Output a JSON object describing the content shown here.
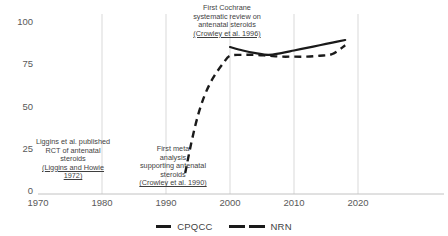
{
  "chart_data": {
    "type": "line",
    "title": "",
    "xlabel": "",
    "ylabel": "",
    "xlim": [
      1970,
      2020
    ],
    "ylim": [
      0,
      100
    ],
    "grid": "vertical-only",
    "legend_position": "bottom-center",
    "xticks": [
      "1970",
      "1980",
      "1990",
      "2000",
      "2010",
      "2020"
    ],
    "yticks": [
      "0",
      "25",
      "50",
      "75",
      "100"
    ],
    "series": [
      {
        "name": "CPQCC",
        "style": "solid",
        "color": "#1a1a1a",
        "x": [
          2000,
          2002,
          2004,
          2006,
          2008,
          2010,
          2012,
          2014,
          2016,
          2018
        ],
        "values": [
          84,
          82,
          80.5,
          79.5,
          80.5,
          82,
          83.5,
          85,
          86.5,
          88
        ]
      },
      {
        "name": "NRN",
        "style": "dashed",
        "color": "#1a1a1a",
        "x": [
          1993,
          1994,
          1995,
          1996,
          1997,
          1998,
          1999,
          2000,
          2002,
          2004,
          2006,
          2008,
          2010,
          2012,
          2014,
          2016,
          2018
        ],
        "values": [
          12,
          30,
          45,
          56,
          64,
          70,
          75,
          79,
          79.5,
          79.5,
          79,
          78.5,
          78.5,
          78.5,
          79,
          80,
          85
        ]
      }
    ],
    "annotations": [
      {
        "id": "liggins",
        "lines": [
          "Liggins et al. published",
          "RCT of antenatal",
          "steroids"
        ],
        "citation": [
          "(Liggins and Howie",
          "1972)"
        ]
      },
      {
        "id": "first-meta-analysis",
        "lines": [
          "First meta",
          "analysis",
          "supporting antenatal",
          "steroids"
        ],
        "citation": [
          "(Crowley et al. 1990)"
        ]
      },
      {
        "id": "first-cochrane",
        "lines": [
          "First Cochrane",
          "systematic review on",
          "antenatal steroids"
        ],
        "citation": [
          "(Crowley et al. 1996)"
        ]
      }
    ]
  },
  "legend": {
    "cpqcc_label": "CPQCC",
    "nrn_label": "NRN"
  },
  "annotations": {
    "liggins": {
      "l1": "Liggins et al. published",
      "l2": "RCT of antenatal",
      "l3": "steroids",
      "c1": "(Liggins and Howie",
      "c2": "1972)"
    },
    "meta": {
      "l1": "First meta",
      "l2": "analysis",
      "l3": "supporting antenatal",
      "l4": "steroids",
      "c1": "(Crowley et al. 1990)"
    },
    "cochrane": {
      "l1": "First Cochrane",
      "l2": "systematic review on",
      "l3": "antenatal steroids",
      "c1": "(Crowley et al. 1996)"
    }
  },
  "axes": {
    "y": [
      "100",
      "75",
      "50",
      "25",
      "0"
    ],
    "x": [
      "1970",
      "1980",
      "1990",
      "2000",
      "2010",
      "2020"
    ]
  }
}
